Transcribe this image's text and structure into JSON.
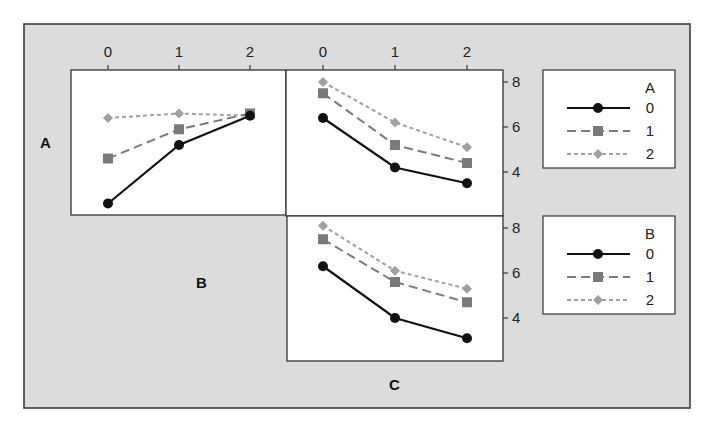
{
  "chart_data": {
    "type": "line",
    "factors": [
      "A",
      "B",
      "C"
    ],
    "x_tick_labels": [
      "0",
      "1",
      "2"
    ],
    "y_tick_labels": [
      "4",
      "6",
      "8"
    ],
    "ylim": [
      2,
      8.4
    ],
    "grid": false,
    "legend_position": "right",
    "panels": [
      {
        "id": "A-by-B",
        "row_factor": "A",
        "col_factor": "B",
        "x": [
          0,
          1,
          2
        ],
        "series": [
          {
            "name": "0",
            "values": [
              2.6,
              5.2,
              6.5
            ]
          },
          {
            "name": "1",
            "values": [
              4.6,
              5.9,
              6.6
            ]
          },
          {
            "name": "2",
            "values": [
              6.4,
              6.6,
              6.5
            ]
          }
        ]
      },
      {
        "id": "A-by-C",
        "row_factor": "A",
        "col_factor": "C",
        "x": [
          0,
          1,
          2
        ],
        "series": [
          {
            "name": "0",
            "values": [
              6.4,
              4.2,
              3.5
            ]
          },
          {
            "name": "1",
            "values": [
              7.5,
              5.2,
              4.4
            ]
          },
          {
            "name": "2",
            "values": [
              8.0,
              6.2,
              5.1
            ]
          }
        ]
      },
      {
        "id": "B-by-C",
        "row_factor": "B",
        "col_factor": "C",
        "x": [
          0,
          1,
          2
        ],
        "series": [
          {
            "name": "0",
            "values": [
              6.3,
              4.0,
              3.1
            ]
          },
          {
            "name": "1",
            "values": [
              7.5,
              5.6,
              4.7
            ]
          },
          {
            "name": "2",
            "values": [
              8.1,
              6.1,
              5.3
            ]
          }
        ]
      }
    ],
    "legends": [
      {
        "title": "A",
        "entries": [
          "0",
          "1",
          "2"
        ]
      },
      {
        "title": "B",
        "entries": [
          "0",
          "1",
          "2"
        ]
      }
    ]
  },
  "labels": {
    "row_a": "A",
    "row_b": "B",
    "col_c": "C"
  },
  "styles": {
    "frame_bg": "#dcdcdc",
    "panel_bg": "#ffffff",
    "series_colors": [
      "#111111",
      "#7a7a7a",
      "#a0a0a0"
    ]
  }
}
